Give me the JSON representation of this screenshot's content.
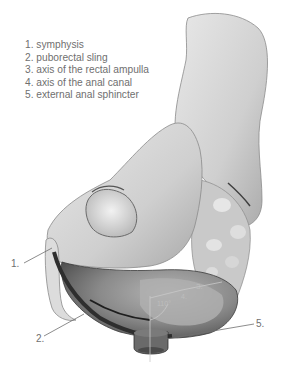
{
  "figure": {
    "legend": [
      {
        "num": "1.",
        "label": "symphysis"
      },
      {
        "num": "2.",
        "label": "puborectal sling"
      },
      {
        "num": "3.",
        "label": "axis of the rectal ampulla"
      },
      {
        "num": "4.",
        "label": "axis of the anal canal"
      },
      {
        "num": "5.",
        "label": "external anal sphincter"
      }
    ],
    "callouts": {
      "c1": "1.",
      "c2": "2.",
      "c3": "3.",
      "c4": "4.",
      "c5": "5.",
      "angle": "110°"
    },
    "colors": {
      "bone": "#d9d9d9",
      "bone_shadow": "#9a9a9a",
      "rectum": "#6e6e6e",
      "rectum_light": "#a8a8a8",
      "sling": "#3a3a3a",
      "text": "#6f6f6f"
    }
  }
}
